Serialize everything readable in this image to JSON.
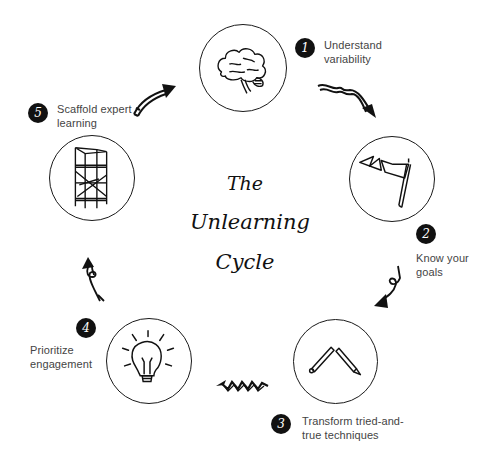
{
  "diagram": {
    "title_lines": [
      "The",
      "Unlearning",
      "Cycle"
    ],
    "steps": [
      {
        "number": "1",
        "label_lines": [
          "Understand",
          "variability"
        ],
        "icon": "brain-icon"
      },
      {
        "number": "2",
        "label_lines": [
          "Know your",
          "goals"
        ],
        "icon": "flag-icon"
      },
      {
        "number": "3",
        "label_lines": [
          "Transform tried-and-",
          "true techniques"
        ],
        "icon": "pencils-icon"
      },
      {
        "number": "4",
        "label_lines": [
          "Prioritize",
          "engagement"
        ],
        "icon": "lightbulb-icon"
      },
      {
        "number": "5",
        "label_lines": [
          "Scaffold expert",
          "learning"
        ],
        "icon": "scaffold-icon"
      }
    ],
    "colors": {
      "ink": "#111111",
      "label_text": "#444444",
      "background": "#ffffff"
    }
  }
}
